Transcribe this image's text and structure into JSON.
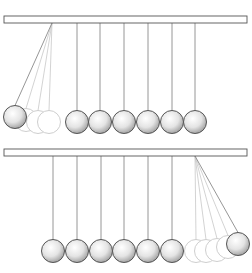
{
  "figure": {
    "panels": [
      {
        "id": "top",
        "bar": {
          "x": 4,
          "y": 16,
          "w": 243,
          "h": 7
        },
        "resting_balls_x": [
          77,
          100,
          124,
          148,
          172,
          195
        ],
        "ball_y": 122,
        "ball_r": 11.5,
        "swing": {
          "pivot": [
            52,
            23
          ],
          "solid": [
            15,
            117
          ],
          "ghosts": [
            [
              26,
              120
            ],
            [
              38,
              122
            ],
            [
              49,
              122
            ]
          ]
        }
      },
      {
        "id": "bottom",
        "bar": {
          "x": 4,
          "y": 149,
          "w": 243,
          "h": 7
        },
        "resting_balls_x": [
          53,
          77,
          101,
          124,
          148,
          172
        ],
        "ball_y": 251,
        "ball_r": 11.5,
        "swing": {
          "pivot": [
            195,
            156
          ],
          "solid": [
            238,
            244
          ],
          "ghosts": [
            [
              196,
              251
            ],
            [
              206,
              251
            ],
            [
              217,
              250
            ],
            [
              228,
              247
            ]
          ]
        }
      }
    ],
    "colors": {
      "stroke": "#555555",
      "string": "#8a8a8a",
      "ghost": "#c8c8c8",
      "ball_light": "#ffffff",
      "ball_dark": "#9a9a9a"
    }
  }
}
